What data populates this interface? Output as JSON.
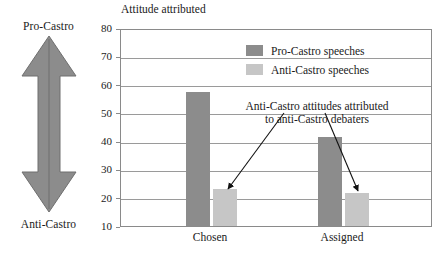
{
  "scale": {
    "top_label": "Pro-Castro",
    "bottom_label": "Anti-Castro",
    "arrow_icon": "double-headed-vertical-arrow",
    "color": "#8c8c8c"
  },
  "chart_data": {
    "type": "bar",
    "title": "Attitude attributed",
    "xlabel": "",
    "ylabel": "",
    "ylim": [
      10,
      80
    ],
    "ytick_step": 10,
    "yticks": [
      10,
      20,
      30,
      40,
      50,
      60,
      70,
      80
    ],
    "grid": true,
    "categories": [
      "Chosen",
      "Assigned"
    ],
    "series": [
      {
        "name": "Pro-Castro speeches",
        "color": "#8c8c8c",
        "values": [
          57.5,
          41.5
        ]
      },
      {
        "name": "Anti-Castro speeches",
        "color": "#c6c6c6",
        "values": [
          23,
          21.5
        ]
      }
    ],
    "legend": {
      "position": "top-right-inside",
      "entries": [
        {
          "label": "Pro-Castro speeches",
          "color": "#8c8c8c"
        },
        {
          "label": "Anti-Castro speeches",
          "color": "#c6c6c6"
        }
      ]
    },
    "annotations": [
      {
        "text_line1": "Anti-Castro attitudes attributed",
        "text_line2": "to anti-Castro debaters",
        "points_to": [
          "Chosen / Anti-Castro speeches",
          "Assigned / Anti-Castro speeches"
        ]
      }
    ]
  }
}
